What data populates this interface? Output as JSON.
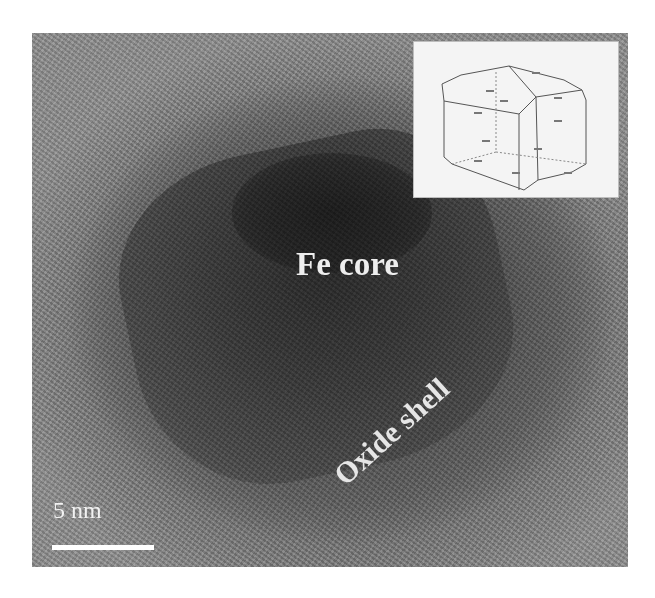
{
  "figure": {
    "type": "TEM micrograph",
    "labels": {
      "core": "Fe core",
      "shell": "Oxide shell"
    },
    "scale_bar": {
      "label": "5 nm"
    },
    "inset": {
      "description": "crystal morphology diagram (truncated cube) with small face labels"
    },
    "colors": {
      "background": "#ffffff",
      "label_text": "#eeeeee",
      "inset_background": "#f4f4f4"
    }
  }
}
